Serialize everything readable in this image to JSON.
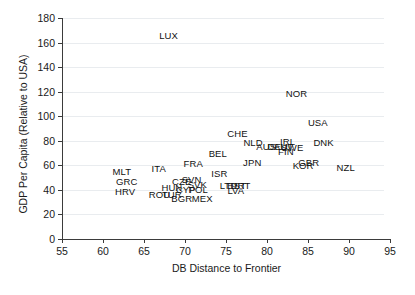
{
  "chart_data": {
    "type": "scatter",
    "title": "",
    "xlabel": "DB Distance to Frontier",
    "ylabel": "GDP Per Capita (Relative to USA)",
    "xlim": [
      55,
      95
    ],
    "ylim": [
      0,
      180
    ],
    "xticks": [
      55,
      60,
      65,
      70,
      75,
      80,
      85,
      90,
      95
    ],
    "yticks": [
      0,
      20,
      40,
      60,
      80,
      100,
      120,
      140,
      160,
      180
    ],
    "grid": "horizontal",
    "legend": "none",
    "marker_style": "text-label",
    "points": [
      {
        "label": "LUX",
        "x": 68.0,
        "y": 166
      },
      {
        "label": "NOR",
        "x": 83.6,
        "y": 119
      },
      {
        "label": "USA",
        "x": 86.2,
        "y": 95
      },
      {
        "label": "CHE",
        "x": 76.4,
        "y": 86
      },
      {
        "label": "NLD",
        "x": 78.3,
        "y": 79
      },
      {
        "label": "AUS",
        "x": 79.9,
        "y": 76
      },
      {
        "label": "DEU",
        "x": 81.3,
        "y": 76
      },
      {
        "label": "IRL",
        "x": 82.5,
        "y": 80
      },
      {
        "label": "AUT",
        "x": 82.0,
        "y": 76
      },
      {
        "label": "SWE",
        "x": 83.1,
        "y": 75
      },
      {
        "label": "FIN",
        "x": 82.3,
        "y": 72
      },
      {
        "label": "DNK",
        "x": 86.9,
        "y": 79
      },
      {
        "label": "BEL",
        "x": 74.0,
        "y": 70
      },
      {
        "label": "FRA",
        "x": 71.0,
        "y": 62
      },
      {
        "label": "ITA",
        "x": 66.8,
        "y": 58
      },
      {
        "label": "JPN",
        "x": 78.2,
        "y": 63
      },
      {
        "label": "GBR",
        "x": 85.1,
        "y": 63
      },
      {
        "label": "KOR",
        "x": 84.4,
        "y": 60
      },
      {
        "label": "NZL",
        "x": 89.6,
        "y": 59
      },
      {
        "label": "MLT",
        "x": 62.3,
        "y": 55
      },
      {
        "label": "GRC",
        "x": 62.9,
        "y": 47
      },
      {
        "label": "HRV",
        "x": 62.7,
        "y": 39
      },
      {
        "label": "ISR",
        "x": 74.2,
        "y": 54
      },
      {
        "label": "CZE",
        "x": 69.6,
        "y": 47
      },
      {
        "label": "SVN",
        "x": 70.8,
        "y": 49
      },
      {
        "label": "SVK",
        "x": 71.5,
        "y": 45
      },
      {
        "label": "HUN",
        "x": 68.4,
        "y": 42
      },
      {
        "label": "CYP",
        "x": 70.1,
        "y": 41
      },
      {
        "label": "POL",
        "x": 71.6,
        "y": 41
      },
      {
        "label": "ROU",
        "x": 66.9,
        "y": 37
      },
      {
        "label": "TUR",
        "x": 68.4,
        "y": 37
      },
      {
        "label": "BGR",
        "x": 69.6,
        "y": 33
      },
      {
        "label": "MEX",
        "x": 72.1,
        "y": 33
      },
      {
        "label": "LTU",
        "x": 75.3,
        "y": 44
      },
      {
        "label": "EST",
        "x": 76.3,
        "y": 44
      },
      {
        "label": "PRT",
        "x": 76.8,
        "y": 44
      },
      {
        "label": "LVA",
        "x": 76.2,
        "y": 40
      }
    ]
  }
}
